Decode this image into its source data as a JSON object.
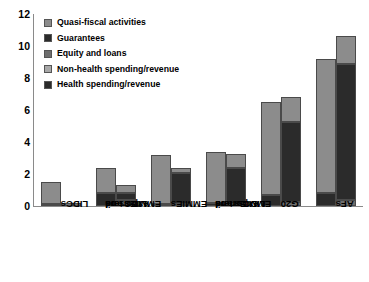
{
  "chart_data": {
    "type": "bar",
    "title": "",
    "xlabel": "",
    "ylabel": "",
    "ylim": [
      0,
      12
    ],
    "yticks": [
      0,
      2,
      4,
      6,
      8,
      10,
      12
    ],
    "grid": false,
    "legend_position": "top-left",
    "stacked": true,
    "grouped": true,
    "bars_per_group": 2,
    "categories": [
      "LIDCs",
      "EMMIEs and LIDCs oil exporters",
      "EMMIEs",
      "EMMIEs and LIDCs n-oil exporters",
      "G20",
      "AFs"
    ],
    "category_lines": [
      [
        "LIDCs"
      ],
      [
        "EMMIEs and",
        "LIDCs oil",
        "exporters"
      ],
      [
        "EMMIEs"
      ],
      [
        "EMMIEs and",
        "LIDCs n-oil",
        "exporters"
      ],
      [
        "G20"
      ],
      [
        "AFs"
      ]
    ],
    "series": [
      {
        "name": "Health spending/revenue",
        "bar": 1,
        "color": "#2b2b2b",
        "values": [
          0.1,
          0.8,
          0.15,
          0.2,
          0.7,
          0.8
        ]
      },
      {
        "name": "Non-health spending/revenue",
        "bar": 1,
        "color": "#8c8c8c",
        "values": [
          1.4,
          1.6,
          3.05,
          3.15,
          5.8,
          8.4
        ]
      },
      {
        "name": "Equity and loans",
        "bar": 2,
        "color": "#6e6e6e",
        "values": [
          0.2,
          0.35,
          0.15,
          0.15,
          0.25,
          0.35
        ]
      },
      {
        "name": "Guarantees",
        "bar": 2,
        "color": "#2b2b2b",
        "values": [
          0.0,
          0.45,
          1.9,
          2.2,
          5.0,
          8.5
        ]
      },
      {
        "name": "Quasi-fiscal activities",
        "bar": 2,
        "color": "#8c8c8c",
        "values": [
          0.0,
          0.5,
          0.35,
          0.9,
          1.55,
          1.75
        ]
      }
    ],
    "bar_totals": {
      "bar1": [
        1.5,
        2.4,
        3.2,
        3.35,
        6.5,
        9.2
      ],
      "bar2": [
        0.2,
        1.3,
        2.4,
        3.25,
        6.8,
        10.6
      ]
    }
  },
  "legend": {
    "items": [
      {
        "label": "Quasi-fiscal activities",
        "color": "#8c8c8c"
      },
      {
        "label": "Guarantees",
        "color": "#2b2b2b"
      },
      {
        "label": "Equity and loans",
        "color": "#6e6e6e"
      },
      {
        "label": "Non-health spending/revenue",
        "color": "#a8a8a8"
      },
      {
        "label": "Health spending/revenue",
        "color": "#2b2b2b"
      }
    ]
  },
  "axis": {
    "y_tick_labels": [
      "12",
      "10",
      "8",
      "6",
      "4",
      "2",
      "0"
    ]
  }
}
